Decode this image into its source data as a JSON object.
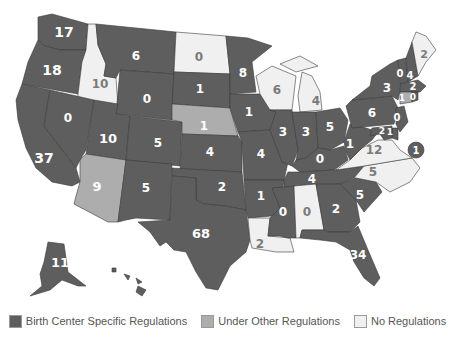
{
  "colors": {
    "specific": "#5e5e5e",
    "other": "#adadad",
    "none": "#f0f0f0",
    "border": "#3a3a3a",
    "legend_text": "#555555"
  },
  "legend": [
    {
      "key": "specific",
      "label": "Birth Center Specific Regulations"
    },
    {
      "key": "other",
      "label": "Under Other Regulations"
    },
    {
      "key": "none",
      "label": "No Regulations"
    }
  ],
  "states": {
    "WA": {
      "name": "Washington",
      "value": "17",
      "category": "specific"
    },
    "OR": {
      "name": "Oregon",
      "value": "18",
      "category": "specific"
    },
    "CA": {
      "name": "California",
      "value": "37",
      "category": "specific"
    },
    "ID": {
      "name": "Idaho",
      "value": "10",
      "category": "none"
    },
    "NV": {
      "name": "Nevada",
      "value": "0",
      "category": "specific"
    },
    "MT": {
      "name": "Montana",
      "value": "6",
      "category": "specific"
    },
    "WY": {
      "name": "Wyoming",
      "value": "0",
      "category": "specific"
    },
    "UT": {
      "name": "Utah",
      "value": "10",
      "category": "specific"
    },
    "AZ": {
      "name": "Arizona",
      "value": "9",
      "category": "other"
    },
    "CO": {
      "name": "Colorado",
      "value": "5",
      "category": "specific"
    },
    "NM": {
      "name": "New Mexico",
      "value": "5",
      "category": "specific"
    },
    "ND": {
      "name": "North Dakota",
      "value": "0",
      "category": "none"
    },
    "SD": {
      "name": "South Dakota",
      "value": "1",
      "category": "specific"
    },
    "NE": {
      "name": "Nebraska",
      "value": "1",
      "category": "other"
    },
    "KS": {
      "name": "Kansas",
      "value": "4",
      "category": "specific"
    },
    "OK": {
      "name": "Oklahoma",
      "value": "2",
      "category": "specific"
    },
    "TX": {
      "name": "Texas",
      "value": "68",
      "category": "specific"
    },
    "MN": {
      "name": "Minnesota",
      "value": "8",
      "category": "specific"
    },
    "IA": {
      "name": "Iowa",
      "value": "1",
      "category": "specific"
    },
    "MO": {
      "name": "Missouri",
      "value": "4",
      "category": "specific"
    },
    "AR": {
      "name": "Arkansas",
      "value": "1",
      "category": "specific"
    },
    "LA": {
      "name": "Louisiana",
      "value": "2",
      "category": "none"
    },
    "WI": {
      "name": "Wisconsin",
      "value": "6",
      "category": "none"
    },
    "IL": {
      "name": "Illinois",
      "value": "3",
      "category": "specific"
    },
    "MI": {
      "name": "Michigan",
      "value": "4",
      "category": "none"
    },
    "IN": {
      "name": "Indiana",
      "value": "3",
      "category": "specific"
    },
    "OH": {
      "name": "Ohio",
      "value": "5",
      "category": "specific"
    },
    "KY": {
      "name": "Kentucky",
      "value": "0",
      "category": "specific"
    },
    "TN": {
      "name": "Tennessee",
      "value": "4",
      "category": "specific"
    },
    "MS": {
      "name": "Mississippi",
      "value": "0",
      "category": "specific"
    },
    "AL": {
      "name": "Alabama",
      "value": "0",
      "category": "none"
    },
    "GA": {
      "name": "Georgia",
      "value": "2",
      "category": "specific"
    },
    "FL": {
      "name": "Florida",
      "value": "34",
      "category": "specific"
    },
    "SC": {
      "name": "South Carolina",
      "value": "5",
      "category": "specific"
    },
    "NC": {
      "name": "North Carolina",
      "value": "5",
      "category": "none"
    },
    "VA": {
      "name": "Virginia",
      "value": "12",
      "category": "none"
    },
    "WV": {
      "name": "West Virginia",
      "value": "1",
      "category": "specific"
    },
    "PA": {
      "name": "Pennsylvania",
      "value": "6",
      "category": "specific"
    },
    "NY": {
      "name": "New York",
      "value": "3",
      "category": "specific"
    },
    "VT": {
      "name": "Vermont",
      "value": "0",
      "category": "specific"
    },
    "NH": {
      "name": "New Hampshire",
      "value": "4",
      "category": "specific"
    },
    "ME": {
      "name": "Maine",
      "value": "2",
      "category": "none"
    },
    "MA": {
      "name": "Massachusetts",
      "value": "2",
      "category": "specific"
    },
    "RI": {
      "name": "Rhode Island",
      "value": "0",
      "category": "specific"
    },
    "CT": {
      "name": "Connecticut",
      "value": "1",
      "category": "other"
    },
    "NJ": {
      "name": "New Jersey",
      "value": "0",
      "category": "specific"
    },
    "MD": {
      "name": "Maryland",
      "value": "2",
      "category": "specific"
    },
    "DE": {
      "name": "Delaware",
      "value": "1",
      "category": "specific"
    },
    "DC": {
      "name": "District of Columbia",
      "value": "1",
      "category": "specific"
    },
    "AK": {
      "name": "Alaska",
      "value": "11",
      "category": "specific"
    },
    "HI": {
      "name": "Hawaii",
      "value": "",
      "category": "specific"
    }
  },
  "small_labels": {
    "ND": "North Dakota",
    "ID": "Idaho",
    "NE": "Nebraska",
    "WI": "Wisconsin",
    "MI": "Michigan",
    "AZ": "Arizona",
    "AL": "Alabama",
    "LA": "Louisiana",
    "NC": "North Carolina",
    "VA": "Virginia",
    "ME": "Maine",
    "MA": "Massachusetts",
    "RI": "Rhode Island",
    "NJ": "New Jersey",
    "DE": "Delaware",
    "MD": "Maryland",
    "HI": "Hawaii"
  }
}
